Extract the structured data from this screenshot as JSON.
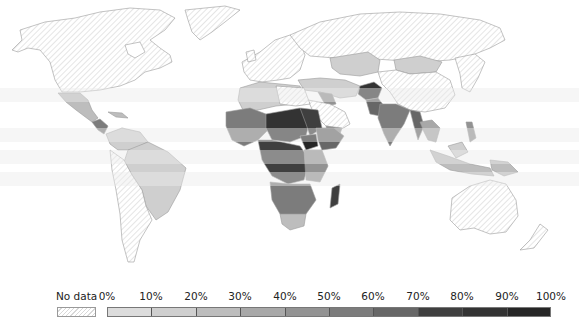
{
  "map": {
    "type": "choropleth",
    "projection": "world",
    "no_data_pattern": "diagonal-hatch",
    "regions_shaded": [
      {
        "region": "Africa (Sahel/Central)",
        "bin": "80-100%"
      },
      {
        "region": "South Sudan",
        "bin": "90-100%"
      },
      {
        "region": "Afghanistan",
        "bin": "80-90%"
      },
      {
        "region": "Pakistan",
        "bin": "60-70%"
      },
      {
        "region": "India",
        "bin": "50-60%"
      },
      {
        "region": "Myanmar",
        "bin": "60-70%"
      },
      {
        "region": "Madagascar",
        "bin": "70-80%"
      },
      {
        "region": "Brazil",
        "bin": "10-20%"
      },
      {
        "region": "Mexico",
        "bin": "20-30%"
      },
      {
        "region": "Central Asia / Mongolia / Kazakhstan",
        "bin": "10-20%"
      },
      {
        "region": "Southern Africa",
        "bin": "20-40%"
      },
      {
        "region": "Southeast Asia",
        "bin": "20-40%"
      }
    ],
    "no_data_regions": [
      "North America",
      "Greenland",
      "Europe",
      "Russia",
      "China",
      "Australia",
      "Argentina/Chile",
      "Saudi Arabia"
    ]
  },
  "legend": {
    "no_data_label": "No data",
    "ticks": [
      "0%",
      "10%",
      "20%",
      "30%",
      "40%",
      "50%",
      "60%",
      "70%",
      "80%",
      "90%",
      "100%"
    ],
    "bin_colors": [
      "#dcdcdc",
      "#cfcfcf",
      "#bdbdbd",
      "#a8a8a8",
      "#939393",
      "#7c7c7c",
      "#676767",
      "#3f3f3f",
      "#333333",
      "#262626"
    ]
  }
}
